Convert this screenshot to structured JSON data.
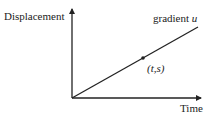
{
  "diagram": {
    "y_axis_label": "Displacement",
    "x_axis_label": "Time",
    "line_label_prefix": "gradient ",
    "line_label_var": "u",
    "point_label": "(t,s)",
    "colors": {
      "ink": "#222222",
      "background": "#ffffff"
    }
  }
}
